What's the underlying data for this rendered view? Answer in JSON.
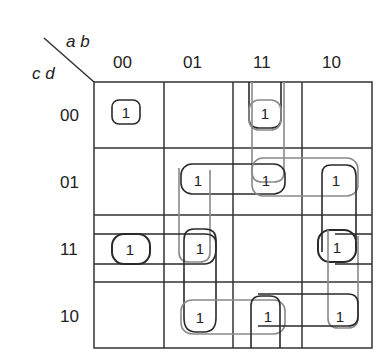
{
  "kmap": {
    "row_variables": "c d",
    "col_variables": "a b",
    "col_labels": [
      "00",
      "01",
      "11",
      "10"
    ],
    "row_labels": [
      "00",
      "01",
      "11",
      "10"
    ],
    "cells": [
      [
        1,
        0,
        1,
        0
      ],
      [
        0,
        1,
        1,
        1
      ],
      [
        1,
        1,
        0,
        1
      ],
      [
        0,
        1,
        1,
        1
      ]
    ],
    "one_symbol": "1",
    "ones": [
      {
        "row": 0,
        "col": 0,
        "label": "1"
      },
      {
        "row": 0,
        "col": 2,
        "label": "1"
      },
      {
        "row": 1,
        "col": 1,
        "label": "1"
      },
      {
        "row": 1,
        "col": 2,
        "label": "1"
      },
      {
        "row": 1,
        "col": 3,
        "label": "1"
      },
      {
        "row": 2,
        "col": 0,
        "label": "1"
      },
      {
        "row": 2,
        "col": 1,
        "label": "1"
      },
      {
        "row": 2,
        "col": 3,
        "label": "1"
      },
      {
        "row": 3,
        "col": 1,
        "label": "1"
      },
      {
        "row": 3,
        "col": 2,
        "label": "1"
      },
      {
        "row": 3,
        "col": 3,
        "label": "1"
      }
    ],
    "colors": {
      "grid": "#333333",
      "loop_dark": "#2a2a2a",
      "loop_light": "#8a8a8a"
    }
  }
}
